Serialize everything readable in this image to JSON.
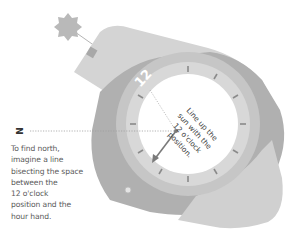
{
  "diagram": {
    "north_label": "N",
    "dial_numeral": "12",
    "face_instruction": [
      "Line up the",
      "sun with the",
      "12 o'clock",
      "position."
    ],
    "caption": [
      "To find north,",
      "imagine a line",
      "bisecting the space",
      "between the",
      "12 o'clock",
      "position and the",
      "hour hand."
    ],
    "elements": {
      "sun": "sun-icon",
      "watch": "wristwatch",
      "hour_hand": "hour-hand-arrow",
      "north_line": "dotted-north-line",
      "sun_line": "sun-alignment-line"
    },
    "colors": {
      "band_light": "#d2d2d2",
      "band_dark": "#a9a9a9",
      "bezel": "#c4c4c4",
      "face": "#ffffff",
      "sun": "#b8b8b8",
      "text": "#5a5a5a",
      "hand": "#7a7a7a"
    }
  }
}
